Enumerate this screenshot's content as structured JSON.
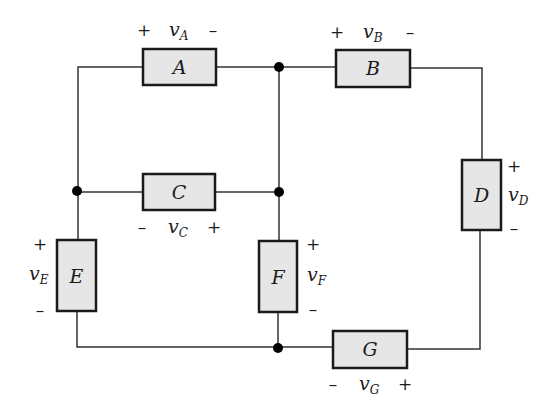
{
  "diagram": {
    "type": "circuit",
    "elements": [
      {
        "id": "A",
        "label": "A",
        "voltage": "v",
        "sub": "A",
        "plus": "+",
        "minus": "–"
      },
      {
        "id": "B",
        "label": "B",
        "voltage": "v",
        "sub": "B",
        "plus": "+",
        "minus": "–"
      },
      {
        "id": "C",
        "label": "C",
        "voltage": "v",
        "sub": "C",
        "plus": "+",
        "minus": "–"
      },
      {
        "id": "D",
        "label": "D",
        "voltage": "v",
        "sub": "D",
        "plus": "+",
        "minus": "–"
      },
      {
        "id": "E",
        "label": "E",
        "voltage": "v",
        "sub": "E",
        "plus": "+",
        "minus": "–"
      },
      {
        "id": "F",
        "label": "F",
        "voltage": "v",
        "sub": "F",
        "plus": "+",
        "minus": "–"
      },
      {
        "id": "G",
        "label": "G",
        "voltage": "v",
        "sub": "G",
        "plus": "+",
        "minus": "–"
      }
    ],
    "nodes": 4,
    "colors": {
      "box_fill": "#e6e6e6",
      "stroke": "#1a1a1a"
    }
  }
}
